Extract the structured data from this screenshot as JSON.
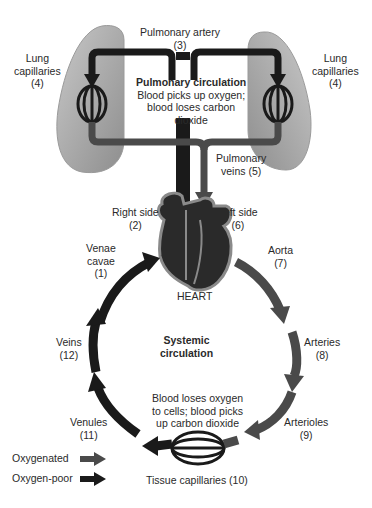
{
  "diagram": {
    "pulmonary": {
      "heading": "Pulmonary circulation",
      "description": [
        "Blood picks up oxygen;",
        "blood loses carbon",
        "dioxide"
      ]
    },
    "systemic": {
      "heading": [
        "Systemic",
        "circulation"
      ],
      "description": [
        "Blood loses oxygen",
        "to cells; blood picks",
        "up carbon dioxide"
      ]
    },
    "heart_label": "HEART",
    "labels": {
      "pulmonary_artery": [
        "Pulmonary artery",
        "(3)"
      ],
      "lung_capillaries_left": [
        "Lung",
        "capillaries",
        "(4)"
      ],
      "lung_capillaries_right": [
        "Lung",
        "capillaries",
        "(4)"
      ],
      "pulmonary_veins": [
        "Pulmonary",
        "veins (5)"
      ],
      "right_side": [
        "Right side",
        "(2)"
      ],
      "left_side": [
        "Left side",
        "(6)"
      ],
      "venae_cavae": [
        "Venae",
        "cavae",
        "(1)"
      ],
      "aorta": [
        "Aorta",
        "(7)"
      ],
      "veins": [
        "Veins",
        "(12)"
      ],
      "arteries": [
        "Arteries",
        "(8)"
      ],
      "venules": [
        "Venules",
        "(11)"
      ],
      "arterioles": [
        "Arterioles",
        "(9)"
      ],
      "tissue_capillaries": "Tissue capillaries (10)"
    },
    "legend": [
      {
        "label": "Oxygenated",
        "color": "#4a4a4a"
      },
      {
        "label": "Oxygen-poor",
        "color": "#1a1a1a"
      }
    ],
    "colors": {
      "oxygenated": "#4a4a4a",
      "oxygen_poor": "#1a1a1a",
      "lung": "#a8a8a8",
      "heart_outline": "#8a8a8a"
    }
  }
}
